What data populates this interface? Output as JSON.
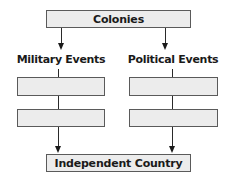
{
  "diagram": {
    "type": "flowchart",
    "top_node": {
      "label": "Colonies"
    },
    "branches": [
      {
        "label": "Military Events",
        "boxes": [
          "",
          ""
        ]
      },
      {
        "label": "Political Events",
        "boxes": [
          "",
          ""
        ]
      }
    ],
    "bottom_node": {
      "label": "Independent Country"
    },
    "colors": {
      "box_fill": "#ececec",
      "box_border": "#5a5a5a",
      "line": "#1a1a1a"
    }
  }
}
